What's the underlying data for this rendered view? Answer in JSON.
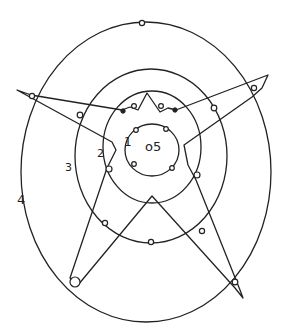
{
  "diagram": {
    "type": "hand-drawn concentric rings with star polygon",
    "stroke_color": "#222222",
    "background": "#ffffff",
    "rings": [
      {
        "id": "ring-0-5",
        "label": "o5",
        "cx": 150,
        "cy": 150,
        "rx": 27,
        "ry": 25
      },
      {
        "id": "ring-1",
        "label": "1",
        "cx": 150,
        "cy": 148,
        "rx": 48,
        "ry": 55
      },
      {
        "id": "ring-3",
        "label": "3",
        "cx": 150,
        "cy": 155,
        "rx": 76,
        "ry": 87
      },
      {
        "id": "ring-4",
        "label": "4",
        "cx": 146,
        "cy": 172,
        "rx": 125,
        "ry": 150
      }
    ],
    "labels": [
      {
        "id": "label-0-5",
        "text": "o5",
        "x": 145,
        "y": 139
      },
      {
        "id": "label-1",
        "text": "1",
        "x": 124,
        "y": 139
      },
      {
        "id": "label-2",
        "text": "2",
        "x": 97,
        "y": 148
      },
      {
        "id": "label-3",
        "text": "3",
        "x": 65,
        "y": 163
      },
      {
        "id": "label-4",
        "text": "4",
        "x": 18,
        "y": 196
      }
    ]
  }
}
